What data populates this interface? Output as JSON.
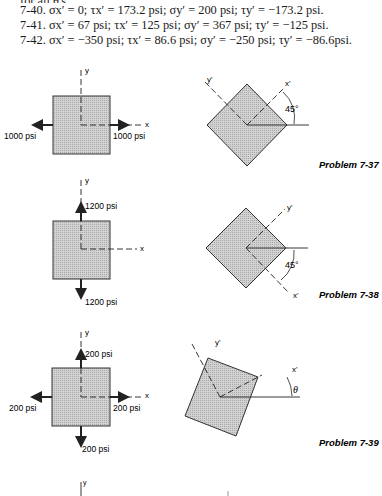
{
  "answers": {
    "cut_line": "for all θ's.",
    "lines": [
      "7-40. σx′ = 0; τx′ = 173.2 psi; σy′ = 200 psi; τy′ = −173.2 psi.",
      "7-41. σx′ = 67 psi; τx′ = 125 psi; σy′ = 367 psi; τy′ = −125 psi.",
      "7-42. σx′ = −350 psi; τx′ = 86.6 psi; σy′ = −250 psi; τy′ = −86.6psi."
    ]
  },
  "problems": [
    {
      "label": "Problem 7-37",
      "element": {
        "axis_x": "x",
        "axis_y": "y",
        "left_load": "1000 psi",
        "right_load": "1000 psi"
      },
      "rotated": {
        "axis_x": "x'",
        "axis_y": "y'",
        "angle": "45°"
      }
    },
    {
      "label": "Problem 7-38",
      "element": {
        "axis_x": "x",
        "axis_y": "y",
        "top_load": "1200 psi",
        "bottom_load": "1200 psi"
      },
      "rotated": {
        "axis_x": "x'",
        "axis_y": "y'",
        "angle": "45°"
      }
    },
    {
      "label": "Problem 7-39",
      "element": {
        "axis_x": "x",
        "axis_y": "y",
        "top_load": "200 psi",
        "bottom_load": "200 psi",
        "left_load": "200 psi",
        "right_load": "200 psi"
      },
      "rotated": {
        "axis_x": "x'",
        "axis_y": "y'",
        "angle": "θ"
      }
    }
  ],
  "partial": {
    "axis_y": "y",
    "axis_y2": "y'"
  },
  "colors": {
    "fill": "#c9c9c9",
    "stroke": "#333333",
    "text": "#1a1a1a"
  }
}
